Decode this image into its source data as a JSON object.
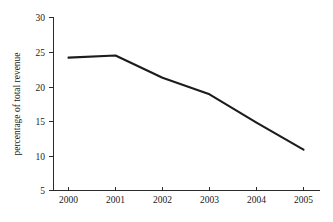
{
  "chart_data": {
    "type": "line",
    "title": "",
    "xlabel": "",
    "ylabel": "percentage of total revenue",
    "categories": [
      "2000",
      "2001",
      "2002",
      "2003",
      "2004",
      "2005"
    ],
    "x": [
      2000,
      2001,
      2002,
      2003,
      2004,
      2005
    ],
    "values": [
      24.2,
      24.5,
      21.3,
      18.9,
      14.8,
      10.9
    ],
    "series": [
      {
        "name": "percentage of total revenue",
        "values": [
          24.2,
          24.5,
          21.3,
          18.9,
          14.8,
          10.9
        ]
      }
    ],
    "xlim": [
      1999.6,
      2005.6
    ],
    "ylim": [
      5,
      30
    ],
    "yticks": [
      5,
      10,
      15,
      20,
      25,
      30
    ],
    "ytick_labels": [
      "5",
      "10",
      "15",
      "20",
      "25",
      "30"
    ],
    "xticks": [
      2000,
      2001,
      2002,
      2003,
      2004,
      2005
    ],
    "xtick_labels": [
      "2000",
      "2001",
      "2002",
      "2003",
      "2004",
      "2005"
    ],
    "grid": false,
    "legend": false,
    "legend_position": "none",
    "line_color": "#1c1c1c",
    "background_color": "#ffffff",
    "axis_color": "#2b2b2b"
  },
  "axes": {
    "y_tick_0": "30",
    "y_tick_1": "25",
    "y_tick_2": "20",
    "y_tick_3": "15",
    "y_tick_4": "10",
    "y_tick_5": "5",
    "x_tick_0": "2000",
    "x_tick_1": "2001",
    "x_tick_2": "2002",
    "x_tick_3": "2003",
    "x_tick_4": "2004",
    "x_tick_5": "2005",
    "y_axis_title": "percentage of total revenue"
  }
}
